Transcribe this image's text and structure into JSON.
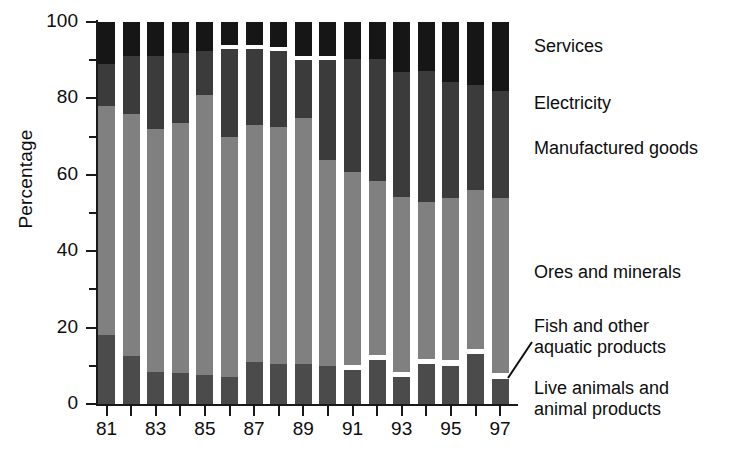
{
  "chart_data": {
    "type": "bar",
    "subtype": "stacked-bar-100-percent",
    "title": "",
    "xlabel": "",
    "ylabel": "Percentage",
    "ylim": [
      0,
      100
    ],
    "yticks": [
      0,
      20,
      40,
      60,
      80,
      100
    ],
    "ytick_labels": [
      "0",
      "20",
      "40",
      "60",
      "80",
      "100"
    ],
    "yticks_minor": [
      10,
      30,
      50,
      70,
      90
    ],
    "grid": false,
    "legend_position": "right-inline",
    "categories": [
      "81",
      "82",
      "83",
      "84",
      "85",
      "86",
      "87",
      "88",
      "89",
      "90",
      "91",
      "92",
      "93",
      "94",
      "95",
      "96",
      "97"
    ],
    "xtick_labels_visible": [
      "81",
      "83",
      "85",
      "87",
      "89",
      "91",
      "93",
      "95",
      "97"
    ],
    "series": [
      {
        "name": "Live animals and animal products",
        "color": "#4b4b4b",
        "values": [
          18.0,
          12.5,
          8.5,
          8.0,
          7.5,
          7.0,
          11.0,
          10.5,
          10.5,
          10.0,
          9.0,
          11.5,
          7.0,
          10.5,
          10.0,
          13.0,
          6.5
        ]
      },
      {
        "name": "Fish and other aquatic products",
        "color": "#ffffff",
        "values": [
          0.0,
          0.0,
          0.0,
          0.0,
          0.0,
          0.0,
          0.0,
          0.0,
          0.0,
          0.0,
          1.2,
          1.3,
          1.3,
          1.3,
          1.4,
          1.4,
          1.5
        ]
      },
      {
        "name": "Ores and minerals",
        "color": "#808080",
        "values": [
          60.0,
          63.5,
          63.5,
          65.5,
          73.5,
          63.0,
          62.0,
          62.0,
          64.5,
          54.0,
          50.5,
          45.5,
          46.0,
          41.0,
          42.5,
          41.5,
          46.0
        ]
      },
      {
        "name": "Manufactured goods",
        "color": "#3b3b3b",
        "values": [
          11.0,
          15.0,
          19.0,
          18.5,
          11.5,
          23.0,
          20.0,
          20.0,
          15.0,
          26.0,
          29.5,
          32.0,
          32.5,
          34.5,
          30.5,
          27.5,
          28.0
        ]
      },
      {
        "name": "Electricity",
        "color": "#ffffff",
        "values": [
          0.0,
          0.0,
          0.0,
          0.0,
          0.0,
          1.0,
          1.0,
          1.0,
          1.0,
          1.0,
          0.0,
          0.0,
          0.0,
          0.0,
          0.0,
          0.0,
          0.0
        ]
      },
      {
        "name": "Services",
        "color": "#161616",
        "values": [
          11.0,
          9.0,
          9.0,
          8.0,
          7.5,
          6.0,
          6.0,
          6.5,
          9.0,
          9.0,
          9.8,
          9.7,
          13.2,
          12.7,
          15.6,
          16.6,
          18.0
        ]
      }
    ]
  },
  "legend": {
    "services": "Services",
    "electricity": "Electricity",
    "manufactured": "Manufactured goods",
    "ores": "Ores and minerals",
    "fish": "Fish and other\naquatic products",
    "live": "Live animals and\nanimal products"
  },
  "axes": {
    "y_title": "Percentage"
  }
}
